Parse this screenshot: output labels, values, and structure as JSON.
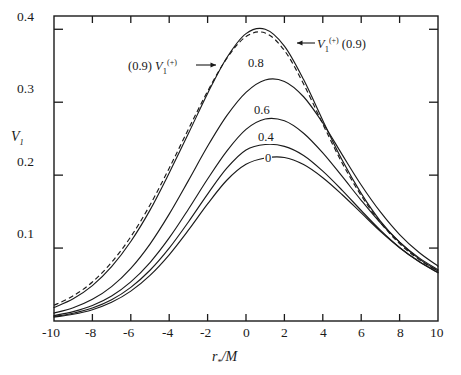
{
  "chart_data": {
    "type": "line",
    "title": "",
    "xlabel": "r*/M",
    "ylabel": "V1",
    "xlim": [
      -10,
      10
    ],
    "ylim": [
      0,
      0.4182
    ],
    "grid": false,
    "legend_position": "inline-annotations",
    "xticks": [
      -10,
      -8,
      -6,
      -4,
      -2,
      0,
      2,
      4,
      6,
      8,
      10
    ],
    "xticklabels": [
      "-10",
      "-8",
      "-6",
      "-4",
      "-2",
      "0",
      "2",
      "4",
      "6",
      "8",
      "10"
    ],
    "yticks": [
      0.1,
      0.2,
      0.3,
      0.4
    ],
    "yticklabels": [
      "0.1",
      "0.2",
      "0.3",
      "0.4"
    ],
    "series": [
      {
        "name": "V1+(0.9)",
        "label": "",
        "style": "solid",
        "peak_x": 0.0,
        "peak_y": 0.402,
        "x": [
          -10,
          -9,
          -8,
          -7,
          -6,
          -5,
          -4,
          -3,
          -2,
          -1,
          0,
          1,
          2,
          3,
          4,
          5,
          6,
          7,
          8,
          9,
          10
        ],
        "y": [
          0.0185,
          0.0305,
          0.0485,
          0.0745,
          0.109,
          0.152,
          0.203,
          0.257,
          0.312,
          0.361,
          0.394,
          0.4,
          0.377,
          0.331,
          0.275,
          0.221,
          0.175,
          0.137,
          0.108,
          0.0855,
          0.0685
        ]
      },
      {
        "name": "(0.9) V1+",
        "label": "",
        "style": "dashed",
        "peak_x": -0.1,
        "peak_y": 0.4,
        "x": [
          -10,
          -9,
          -8,
          -7,
          -6,
          -5,
          -4,
          -3,
          -2,
          -1,
          0,
          1,
          2,
          3,
          4,
          5,
          6,
          7,
          8,
          9,
          10
        ],
        "y": [
          0.0215,
          0.0345,
          0.0535,
          0.0805,
          0.1155,
          0.159,
          0.2095,
          0.263,
          0.315,
          0.36,
          0.39,
          0.395,
          0.371,
          0.325,
          0.27,
          0.217,
          0.172,
          0.135,
          0.106,
          0.0845,
          0.068
        ]
      },
      {
        "name": "0.8",
        "label": "0.8",
        "style": "solid",
        "peak_x": 0.7,
        "peak_y": 0.3385,
        "x": [
          -10,
          -9,
          -8,
          -7,
          -6,
          -5,
          -4,
          -3,
          -2,
          -1,
          0,
          1,
          2,
          3,
          4,
          5,
          6,
          7,
          8,
          9,
          10
        ],
        "y": [
          0.0108,
          0.0182,
          0.0297,
          0.0472,
          0.0722,
          0.1055,
          0.1465,
          0.1925,
          0.2395,
          0.2815,
          0.3135,
          0.3305,
          0.3285,
          0.3075,
          0.2715,
          0.2285,
          0.1865,
          0.1495,
          0.1185,
          0.0942,
          0.0752
        ]
      },
      {
        "name": "0.6",
        "label": "0.6",
        "style": "solid",
        "peak_x": 1.25,
        "peak_y": 0.2775,
        "x": [
          -10,
          -9,
          -8,
          -7,
          -6,
          -5,
          -4,
          -3,
          -2,
          -1,
          0,
          1,
          2,
          3,
          4,
          5,
          6,
          7,
          8,
          9,
          10
        ],
        "y": [
          0.0075,
          0.0128,
          0.0212,
          0.0343,
          0.0537,
          0.0802,
          0.1139,
          0.1533,
          0.1947,
          0.233,
          0.2628,
          0.277,
          0.2745,
          0.2575,
          0.2305,
          0.1985,
          0.1655,
          0.1345,
          0.1082,
          0.0869,
          0.0702
        ]
      },
      {
        "name": "0.4",
        "label": "0.4",
        "style": "solid",
        "peak_x": 1.55,
        "peak_y": 0.2425,
        "x": [
          -10,
          -9,
          -8,
          -7,
          -6,
          -5,
          -4,
          -3,
          -2,
          -1,
          0,
          1,
          2,
          3,
          4,
          5,
          6,
          7,
          8,
          9,
          10
        ],
        "y": [
          0.0062,
          0.0107,
          0.0178,
          0.0291,
          0.0461,
          0.0696,
          0.0999,
          0.1358,
          0.174,
          0.2095,
          0.2345,
          0.242,
          0.2395,
          0.227,
          0.2055,
          0.1795,
          0.1515,
          0.1245,
          0.1008,
          0.0815,
          0.0661
        ]
      },
      {
        "name": "0",
        "label": "0",
        "style": "solid",
        "peak_x": 1.9,
        "peak_y": 0.2242,
        "x": [
          -10,
          -9,
          -8,
          -7,
          -6,
          -5,
          -4,
          -3,
          -2,
          -1,
          0,
          1,
          2,
          3,
          4,
          5,
          6,
          7,
          8,
          9,
          10
        ],
        "y": [
          0.0053,
          0.0092,
          0.0155,
          0.0256,
          0.041,
          0.0626,
          0.0908,
          0.1245,
          0.1605,
          0.193,
          0.2148,
          0.2235,
          0.2242,
          0.2145,
          0.1965,
          0.1735,
          0.1482,
          0.123,
          0.1005,
          0.0818,
          0.0665
        ]
      }
    ],
    "annotations": [
      {
        "id": "left-annotation",
        "text_plain": "(0.9) V1(+)",
        "prefix": "(0.9)",
        "symbol": "V",
        "subscript": "1",
        "superscript": "(+)",
        "suffix": "",
        "arrow": "right"
      },
      {
        "id": "right-annotation",
        "text_plain": "V1(+) (0.9)",
        "prefix": "",
        "symbol": "V",
        "subscript": "1",
        "superscript": "(+)",
        "suffix": "(0.9)",
        "arrow": "left"
      }
    ],
    "curve_labels": [
      "0.8",
      "0.6",
      "0.4",
      "0"
    ],
    "colors": {
      "ink": "#1a1a1a",
      "background": "#ffffff"
    }
  },
  "axes": {
    "y_label": "V",
    "y_label_sub": "1",
    "x_label_symbol": "r",
    "x_label_sub": "*",
    "x_label_rest": "/M",
    "yticklabels": [
      "0.4",
      "0.3",
      "0.2",
      "0.1"
    ],
    "xticklabels": [
      "-10",
      "-8",
      "-6",
      "-4",
      "-2",
      "0",
      "2",
      "4",
      "6",
      "8",
      "10"
    ]
  }
}
